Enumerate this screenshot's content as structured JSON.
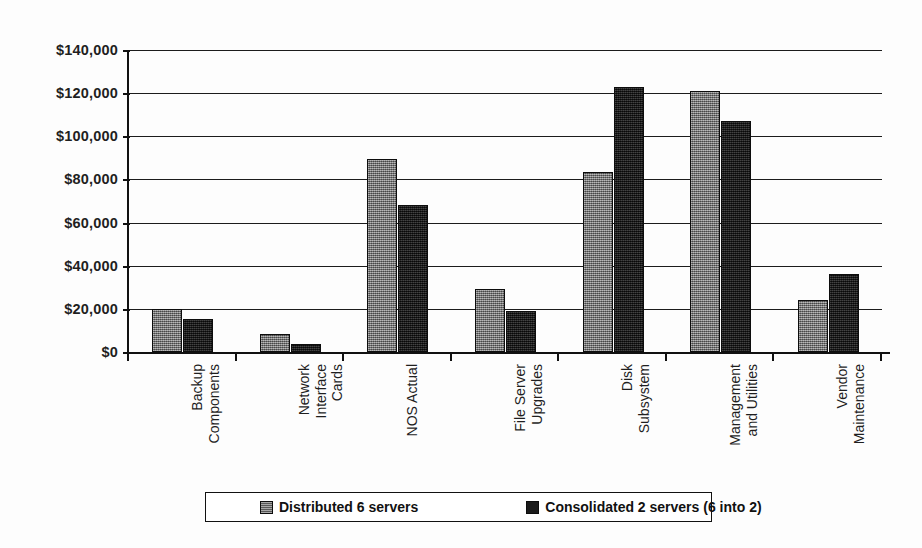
{
  "chart_data": {
    "type": "bar",
    "title": "",
    "subtitle": "",
    "xlabel": "",
    "ylabel": "",
    "ylim": [
      0,
      140000
    ],
    "ytick_values": [
      0,
      20000,
      40000,
      60000,
      80000,
      100000,
      120000,
      140000
    ],
    "ytick_labels": [
      "$0",
      "$20,000",
      "$40,000",
      "$60,000",
      "$80,000",
      "$100,000",
      "$120,000",
      "$140,000"
    ],
    "grid": "horizontal",
    "legend_position": "bottom",
    "categories": [
      "Backup\nComponents",
      "Network\nInterface\nCards",
      "NOS Actual",
      "File Server\nUpgrades",
      "Disk\nSubsystem",
      "Management\nand Utilities",
      "Vendor\nMaintenance"
    ],
    "series": [
      {
        "name": "Distributed 6 servers",
        "color": "#7d7d7d",
        "values": [
          20000,
          8500,
          89500,
          29000,
          83500,
          121000,
          24000
        ]
      },
      {
        "name": "Consolidated 2 servers (6 into 2)",
        "color": "#1e1e1e",
        "values": [
          15500,
          3500,
          68000,
          19000,
          123000,
          107000,
          36000
        ]
      }
    ]
  },
  "legend": {
    "items": [
      {
        "label": "Distributed 6 servers"
      },
      {
        "label": "Consolidated 2 servers (6 into 2)"
      }
    ]
  }
}
